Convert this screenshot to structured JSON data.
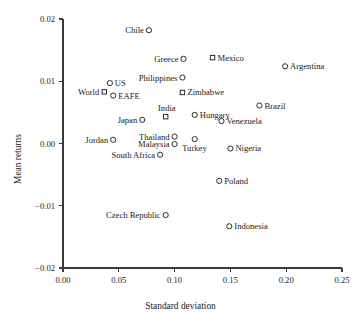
{
  "chart_data": {
    "type": "scatter",
    "title": "",
    "xlabel": "Standard deviation",
    "ylabel": "Mean returns",
    "xlim": [
      0.0,
      0.25
    ],
    "ylim": [
      -0.02,
      0.02
    ],
    "xticks": [
      "0.00",
      "0.05",
      "0.10",
      "0.15",
      "0.20",
      "0.25"
    ],
    "xtick_values": [
      0.0,
      0.05,
      0.1,
      0.15,
      0.2,
      0.25
    ],
    "yticks": [
      "0.02",
      "0.01",
      "0.00",
      "−0.01",
      "−0.02"
    ],
    "ytick_values": [
      0.02,
      0.01,
      0.0,
      -0.01,
      -0.02
    ],
    "grid": false,
    "legend": "none",
    "marker_shapes": [
      "circle",
      "square"
    ],
    "points": [
      {
        "label": "Chile",
        "x": 0.077,
        "y": 0.0182,
        "marker": "circle",
        "label_side": "left"
      },
      {
        "label": "Mexico",
        "x": 0.134,
        "y": 0.0138,
        "marker": "square",
        "label_side": "right"
      },
      {
        "label": "Greece",
        "x": 0.108,
        "y": 0.0136,
        "marker": "circle",
        "label_side": "left"
      },
      {
        "label": "Argentina",
        "x": 0.199,
        "y": 0.0124,
        "marker": "circle",
        "label_side": "right"
      },
      {
        "label": "Philippines",
        "x": 0.107,
        "y": 0.0106,
        "marker": "circle",
        "label_side": "left"
      },
      {
        "label": "US",
        "x": 0.042,
        "y": 0.0097,
        "marker": "circle",
        "label_side": "right"
      },
      {
        "label": "World",
        "x": 0.037,
        "y": 0.0083,
        "marker": "square",
        "label_side": "left"
      },
      {
        "label": "Zimbabwe",
        "x": 0.107,
        "y": 0.0082,
        "marker": "square",
        "label_side": "right"
      },
      {
        "label": "EAFE",
        "x": 0.045,
        "y": 0.0077,
        "marker": "circle",
        "label_side": "right"
      },
      {
        "label": "Brazil",
        "x": 0.176,
        "y": 0.0061,
        "marker": "circle",
        "label_side": "right"
      },
      {
        "label": "Hungary",
        "x": 0.118,
        "y": 0.0046,
        "marker": "circle",
        "label_side": "right"
      },
      {
        "label": "India",
        "x": 0.092,
        "y": 0.0043,
        "marker": "square",
        "label_side": "top"
      },
      {
        "label": "Venezuela",
        "x": 0.142,
        "y": 0.0036,
        "marker": "circle",
        "label_side": "right"
      },
      {
        "label": "Japan",
        "x": 0.071,
        "y": 0.0038,
        "marker": "circle",
        "label_side": "left"
      },
      {
        "label": "Thailand",
        "x": 0.1,
        "y": 0.0011,
        "marker": "circle",
        "label_side": "left"
      },
      {
        "label": "Jordan",
        "x": 0.045,
        "y": 0.0006,
        "marker": "circle",
        "label_side": "left"
      },
      {
        "label": "Turkey",
        "x": 0.118,
        "y": 0.0007,
        "marker": "circle",
        "label_side": "bottom"
      },
      {
        "label": "Malaysia",
        "x": 0.1,
        "y": -0.0001,
        "marker": "circle",
        "label_side": "left"
      },
      {
        "label": "Nigeria",
        "x": 0.15,
        "y": -0.0008,
        "marker": "circle",
        "label_side": "right"
      },
      {
        "label": "South Africa",
        "x": 0.087,
        "y": -0.0018,
        "marker": "circle",
        "label_side": "left"
      },
      {
        "label": "Poland",
        "x": 0.14,
        "y": -0.006,
        "marker": "circle",
        "label_side": "right"
      },
      {
        "label": "Czech Republic",
        "x": 0.092,
        "y": -0.0115,
        "marker": "circle",
        "label_side": "left"
      },
      {
        "label": "Indonesia",
        "x": 0.149,
        "y": -0.0133,
        "marker": "circle",
        "label_side": "right"
      }
    ]
  }
}
